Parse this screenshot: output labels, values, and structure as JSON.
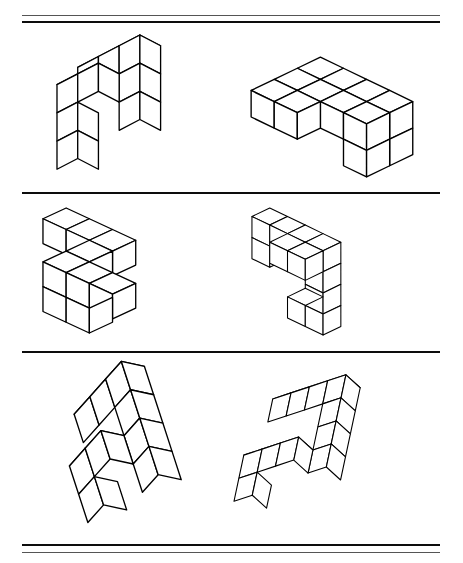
{
  "page": {
    "title": "Mental Rotation Test Sheet",
    "background_color": "#ffffff",
    "ink_color": "#000000",
    "width": 463,
    "height": 563
  },
  "rules": [
    {
      "name": "top-rule-upper",
      "x": 22,
      "y": 15,
      "width": 418,
      "weight": "thin"
    },
    {
      "name": "top-rule-lower",
      "x": 22,
      "y": 21,
      "width": 418,
      "weight": "thick"
    },
    {
      "name": "divider-rule-1",
      "x": 22,
      "y": 192,
      "width": 418,
      "weight": "thick"
    },
    {
      "name": "divider-rule-2",
      "x": 22,
      "y": 351,
      "width": 418,
      "weight": "thick"
    },
    {
      "name": "bottom-rule-upper",
      "x": 22,
      "y": 544,
      "width": 418,
      "weight": "thick"
    },
    {
      "name": "bottom-rule-lower",
      "x": 22,
      "y": 552,
      "width": 418,
      "weight": "thin"
    }
  ],
  "rows": [
    {
      "name": "row-1",
      "label": "Row 1",
      "figures": [
        {
          "name": "figure-1-left",
          "label": "Block figure 1A",
          "x": 52,
          "y": 30,
          "w": 135,
          "h": 155,
          "cube": 30,
          "dx": 25,
          "dy": -13,
          "dz": 34,
          "cells": [
            [
              0,
              0,
              0
            ],
            [
              1,
              0,
              0
            ],
            [
              2,
              0,
              0
            ],
            [
              2,
              0,
              -1
            ],
            [
              0,
              1,
              -1
            ],
            [
              1,
              1,
              -1
            ],
            [
              0,
              1,
              -2
            ],
            [
              2,
              0,
              -2
            ],
            [
              0,
              1,
              -3
            ]
          ]
        },
        {
          "name": "figure-1-right",
          "label": "Block figure 1B",
          "x": 246,
          "y": 52,
          "w": 175,
          "h": 130,
          "cube": 27,
          "dx": 27,
          "dy": 13,
          "dz": 31,
          "cells": [
            [
              0,
              0,
              0
            ],
            [
              1,
              0,
              0
            ],
            [
              2,
              0,
              0
            ],
            [
              3,
              0,
              0
            ],
            [
              0,
              1,
              0
            ],
            [
              1,
              1,
              0
            ],
            [
              2,
              1,
              0
            ],
            [
              3,
              1,
              0
            ],
            [
              3,
              0,
              -1
            ],
            [
              3,
              1,
              -1
            ],
            [
              0,
              2,
              0
            ],
            [
              1,
              2,
              0
            ]
          ]
        }
      ]
    },
    {
      "name": "row-2",
      "label": "Row 2",
      "figures": [
        {
          "name": "figure-2-left",
          "label": "Block figure 2A",
          "x": 38,
          "y": 203,
          "w": 185,
          "h": 135,
          "cube": 28,
          "dx": 28,
          "dy": 13,
          "dz": 30,
          "cells": [
            [
              0,
              0,
              0
            ],
            [
              1,
              0,
              0
            ],
            [
              2,
              0,
              0
            ],
            [
              2,
              1,
              0
            ],
            [
              2,
              2,
              0
            ],
            [
              3,
              2,
              0
            ],
            [
              4,
              2,
              0
            ],
            [
              2,
              2,
              -1
            ],
            [
              3,
              2,
              -1
            ]
          ]
        },
        {
          "name": "figure-2-right",
          "label": "Block figure 2B",
          "x": 248,
          "y": 204,
          "w": 180,
          "h": 135,
          "cube": 28,
          "dx": 27,
          "dy": 13,
          "dz": 32,
          "cells": [
            [
              0,
              0,
              0
            ],
            [
              1,
              0,
              0
            ],
            [
              2,
              0,
              0
            ],
            [
              3,
              0,
              0
            ],
            [
              3,
              0,
              -1
            ],
            [
              3,
              0,
              -2
            ],
            [
              3,
              0,
              -3
            ],
            [
              2,
              0,
              -3
            ],
            [
              0,
              0,
              -1
            ],
            [
              2,
              1,
              0
            ],
            [
              3,
              1,
              0
            ]
          ]
        }
      ]
    },
    {
      "name": "row-3",
      "label": "Row 3",
      "figures": [
        {
          "name": "figure-3-left",
          "label": "Block figure 3A",
          "x": 60,
          "y": 362,
          "w": 155,
          "h": 165,
          "cube": 30,
          "dx": 24,
          "dy": -14,
          "dz": 35,
          "rotate": -18,
          "cells": [
            [
              0,
              0,
              0
            ],
            [
              1,
              0,
              0
            ],
            [
              2,
              0,
              0
            ],
            [
              2,
              0,
              -1
            ],
            [
              2,
              0,
              -2
            ],
            [
              2,
              0,
              -3
            ],
            [
              0,
              1,
              -2
            ],
            [
              1,
              1,
              -2
            ],
            [
              0,
              1,
              -3
            ]
          ]
        },
        {
          "name": "figure-3-right",
          "label": "Block figure 3B",
          "x": 243,
          "y": 362,
          "w": 175,
          "h": 165,
          "cube": 29,
          "dx": 24,
          "dy": -14,
          "dz": 34,
          "rotate": 12,
          "cells": [
            [
              0,
              0,
              0
            ],
            [
              1,
              0,
              0
            ],
            [
              2,
              0,
              0
            ],
            [
              3,
              0,
              0
            ],
            [
              3,
              0,
              -1
            ],
            [
              3,
              0,
              -2
            ],
            [
              3,
              0,
              -3
            ],
            [
              0,
              1,
              -3
            ],
            [
              1,
              1,
              -3
            ],
            [
              2,
              1,
              -3
            ],
            [
              0,
              1,
              -4
            ]
          ]
        }
      ]
    }
  ]
}
